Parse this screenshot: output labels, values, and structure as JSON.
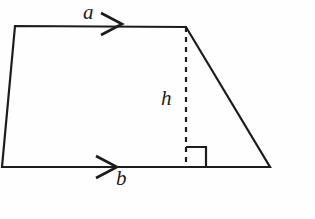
{
  "figure": {
    "name": "trapezoid-with-height",
    "background_color": "#fefefe",
    "stroke_color": "#1c1c1c",
    "stroke_width": 2.2,
    "labels": {
      "top_side": "a",
      "bottom_side": "b",
      "height": "h"
    },
    "geometry": {
      "vertices": {
        "top_left": [
          15,
          26
        ],
        "top_right": [
          186,
          27
        ],
        "bottom_right": [
          270,
          167
        ],
        "bottom_left": [
          2,
          167
        ]
      },
      "height_line": {
        "from": [
          186,
          27
        ],
        "to": [
          186,
          167
        ],
        "style": "dashed",
        "dash_pattern": "5,5"
      },
      "right_angle_marker": {
        "x": 186,
        "y": 147,
        "size": 20,
        "corner": "bottom-right-of-height-foot"
      },
      "arrow_markers": [
        {
          "name": "arrow-top",
          "on": "top_side",
          "tip": [
            122,
            24
          ],
          "direction": "right"
        },
        {
          "name": "arrow-bottom",
          "on": "bottom_side",
          "tip": [
            117,
            167
          ],
          "direction": "right"
        }
      ]
    }
  }
}
